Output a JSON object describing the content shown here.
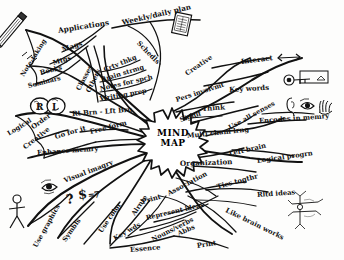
{
  "diagram": {
    "title": "MIND MAP",
    "center": {
      "line1": "MIND",
      "line2": "MAP"
    },
    "ink_color": "#111111",
    "paper_color": "#fdfdfc"
  },
  "branches": [
    {
      "name": "uses",
      "nodes": [
        {
          "id": "note-taking",
          "label": "Note-taking",
          "x": 22,
          "y": 72,
          "rot": -58,
          "size": 6.4
        },
        {
          "id": "seminars",
          "label": "Seminars",
          "x": 28,
          "y": 82,
          "rot": -14,
          "size": 6.4
        },
        {
          "id": "books",
          "label": "Books",
          "x": 40,
          "y": 69,
          "rot": -14,
          "size": 6.6
        },
        {
          "id": "mtgs",
          "label": "Mtgs",
          "x": 53,
          "y": 59,
          "rot": -16,
          "size": 6.6
        },
        {
          "id": "mags",
          "label": "Mags",
          "x": 62,
          "y": 45,
          "rot": -18,
          "size": 7.0
        },
        {
          "id": "applications",
          "label": "Applications",
          "x": 58,
          "y": 26,
          "rot": -9,
          "size": 7.4
        },
        {
          "id": "weekly-daily",
          "label": "Weekly/daily plan",
          "x": 122,
          "y": 18,
          "rot": -13,
          "size": 7.2
        },
        {
          "id": "schedls",
          "label": "Schedls",
          "x": 138,
          "y": 38,
          "rot": 46,
          "size": 6.8
        },
        {
          "id": "classes",
          "label": "Classes",
          "x": 78,
          "y": 86,
          "rot": -62,
          "size": 6.6
        },
        {
          "id": "others",
          "label": "Others",
          "x": 88,
          "y": 88,
          "rot": -64,
          "size": 6.6
        },
        {
          "id": "crtv-thkg",
          "label": "Crtv thkg",
          "x": 104,
          "y": 66,
          "rot": -22,
          "size": 6.6
        },
        {
          "id": "brain-strmg",
          "label": "Brain strmg",
          "x": 101,
          "y": 76,
          "rot": -17,
          "size": 6.6
        },
        {
          "id": "notes-spch",
          "label": "Notes for spch",
          "x": 100,
          "y": 85,
          "rot": -13,
          "size": 6.6
        },
        {
          "id": "writing-prep",
          "label": "Writing prep",
          "x": 100,
          "y": 95,
          "rot": -10,
          "size": 6.6
        }
      ]
    },
    {
      "name": "brain",
      "nodes": [
        {
          "id": "rt-lft-brn",
          "label": "Rt Brn - Lft Brn",
          "x": 72,
          "y": 110,
          "rot": -4,
          "size": 6.8
        },
        {
          "id": "logical",
          "label": "Logical",
          "x": 8,
          "y": 130,
          "rot": -32,
          "size": 6.6
        },
        {
          "id": "order",
          "label": "Order",
          "x": 32,
          "y": 124,
          "rot": -36,
          "size": 6.8
        },
        {
          "id": "creative",
          "label": "Creative",
          "x": 24,
          "y": 144,
          "rot": -38,
          "size": 6.8
        },
        {
          "id": "go-for-it",
          "label": "Go for it",
          "x": 55,
          "y": 133,
          "rot": -16,
          "size": 6.8
        },
        {
          "id": "free-form",
          "label": "Free form",
          "x": 90,
          "y": 128,
          "rot": -14,
          "size": 6.8
        },
        {
          "id": "enhance-memry",
          "label": "Enhance memry",
          "x": 37,
          "y": 149,
          "rot": -4,
          "size": 6.8
        }
      ]
    },
    {
      "name": "visual",
      "nodes": [
        {
          "id": "visual-imagry",
          "label": "Visual imagry",
          "x": 64,
          "y": 177,
          "rot": -21,
          "size": 6.8
        },
        {
          "id": "use-graphics",
          "label": "Use graphics",
          "x": 35,
          "y": 243,
          "rot": -61,
          "size": 6.6
        },
        {
          "id": "symbls",
          "label": "Symbls",
          "x": 64,
          "y": 237,
          "rot": -55,
          "size": 6.6
        },
        {
          "id": "use-color",
          "label": "Use color",
          "x": 100,
          "y": 228,
          "rot": -55,
          "size": 6.6
        },
        {
          "id": "alrnte",
          "label": "Alrnte",
          "x": 133,
          "y": 211,
          "rot": -56,
          "size": 6.6
        },
        {
          "id": "key-wds",
          "label": "Key wds",
          "x": 114,
          "y": 235,
          "rot": -30,
          "size": 6.6
        },
        {
          "id": "essence",
          "label": "Essence",
          "x": 130,
          "y": 246,
          "rot": -5,
          "size": 6.8
        },
        {
          "id": "nouns-verbs",
          "label": "Nouns/verbs",
          "x": 152,
          "y": 236,
          "rot": -27,
          "size": 6.6
        },
        {
          "id": "abbs",
          "label": "Abbs",
          "x": 178,
          "y": 230,
          "rot": -24,
          "size": 6.6
        },
        {
          "id": "print-low",
          "label": "Print",
          "x": 197,
          "y": 242,
          "rot": -9,
          "size": 6.8
        },
        {
          "id": "print-up",
          "label": "Print",
          "x": 142,
          "y": 198,
          "rot": -16,
          "size": 6.8
        },
        {
          "id": "represent",
          "label": "Represent ideas",
          "x": 146,
          "y": 214,
          "rot": -13,
          "size": 6.6
        }
      ]
    },
    {
      "name": "why",
      "nodes": [
        {
          "id": "pers-involvmt",
          "label": "Pers involvmt",
          "x": 176,
          "y": 96,
          "rot": -18,
          "size": 6.6
        },
        {
          "id": "creative-r",
          "label": "Creative",
          "x": 186,
          "y": 70,
          "rot": -34,
          "size": 6.6
        },
        {
          "id": "interact",
          "label": "Interact",
          "x": 241,
          "y": 57,
          "rot": -7,
          "size": 7.0
        },
        {
          "id": "key-words",
          "label": "Key words",
          "x": 229,
          "y": 85,
          "rot": -3,
          "size": 7.0
        },
        {
          "id": "think",
          "label": "Think",
          "x": 202,
          "y": 104,
          "rot": -4,
          "size": 7.0
        },
        {
          "id": "signif",
          "label": "Signif",
          "x": 180,
          "y": 116,
          "rot": -18,
          "size": 6.6
        },
        {
          "id": "multi-chanl",
          "label": "Multi chanl lrng",
          "x": 187,
          "y": 132,
          "rot": -6,
          "size": 6.8
        },
        {
          "id": "use-all-senses",
          "label": "Use all senses",
          "x": 229,
          "y": 124,
          "rot": -29,
          "size": 6.6
        },
        {
          "id": "encodes",
          "label": "Encodes in memry",
          "x": 259,
          "y": 117,
          "rot": -4,
          "size": 6.8
        },
        {
          "id": "left-brain",
          "label": "Left brain",
          "x": 229,
          "y": 150,
          "rot": -13,
          "size": 6.8
        },
        {
          "id": "logical-progrn",
          "label": "Logical progrn",
          "x": 257,
          "y": 157,
          "rot": -8,
          "size": 6.8
        },
        {
          "id": "organization",
          "label": "Organization",
          "x": 180,
          "y": 159,
          "rot": -2,
          "size": 7.2
        },
        {
          "id": "association",
          "label": "Association",
          "x": 168,
          "y": 190,
          "rot": -28,
          "size": 6.8
        },
        {
          "id": "ties-togthr",
          "label": "Ties togthr",
          "x": 217,
          "y": 183,
          "rot": -15,
          "size": 6.8
        },
        {
          "id": "rltd-ideas",
          "label": "Rltd  ideas",
          "x": 257,
          "y": 191,
          "rot": -4,
          "size": 6.8
        },
        {
          "id": "like-brain",
          "label": "Like brain works",
          "x": 226,
          "y": 206,
          "rot": 26,
          "size": 6.8
        }
      ]
    }
  ],
  "symbols": [
    {
      "id": "question-mark",
      "glyph": "?",
      "x": 66,
      "y": 192,
      "size": 13,
      "rot": -8
    },
    {
      "id": "dollar-sign",
      "glyph": "$",
      "x": 78,
      "y": 187,
      "size": 13,
      "rot": -6
    },
    {
      "id": "equals-sign",
      "glyph": "=",
      "x": 88,
      "y": 190,
      "size": 8,
      "rot": -6
    },
    {
      "id": "seven-digit",
      "glyph": "7",
      "x": 94,
      "y": 190,
      "size": 9,
      "rot": -6
    }
  ],
  "icons": [
    {
      "id": "pencil-icon",
      "name": "pencil-icon",
      "x": 18,
      "y": 18
    },
    {
      "id": "planner-book-icon",
      "name": "planner-book-icon",
      "x": 176,
      "y": 12
    },
    {
      "id": "brain-hemispheres-icon",
      "name": "brain-hemispheres-icon",
      "x": 30,
      "y": 96
    },
    {
      "id": "key-icon",
      "name": "key-icon",
      "x": 286,
      "y": 74
    },
    {
      "id": "ear-icon",
      "name": "ear-icon",
      "x": 290,
      "y": 98
    },
    {
      "id": "eye-icon",
      "name": "eye-icon",
      "x": 304,
      "y": 100
    },
    {
      "id": "hand-icon",
      "name": "hand-icon",
      "x": 318,
      "y": 96
    },
    {
      "id": "arrow-icon",
      "name": "arrow-icon",
      "x": 280,
      "y": 55
    },
    {
      "id": "eye-side-icon",
      "name": "eye-side-icon",
      "x": 44,
      "y": 182
    },
    {
      "id": "stick-figure-icon",
      "name": "stick-figure-icon",
      "x": 10,
      "y": 198
    },
    {
      "id": "neuron-icon",
      "name": "neuron-icon",
      "x": 296,
      "y": 196
    }
  ]
}
